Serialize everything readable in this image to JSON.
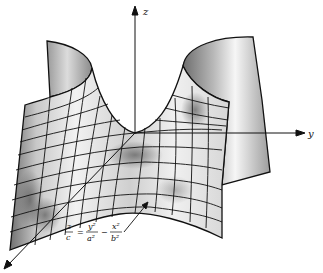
{
  "figure": {
    "axes": {
      "z_label": "z",
      "y_label": "y",
      "x_label": ""
    },
    "equation": {
      "lhs_num": "z",
      "lhs_den": "c",
      "eq_sign": "=",
      "term1_num": "y²",
      "term1_den": "a²",
      "minus_sign": "−",
      "term2_num": "x²",
      "term2_den": "b²"
    },
    "colors": {
      "line": "#111111",
      "background": "#ffffff",
      "shade_dark": "#6a6a6a",
      "shade_light": "#f4f4f4"
    }
  }
}
